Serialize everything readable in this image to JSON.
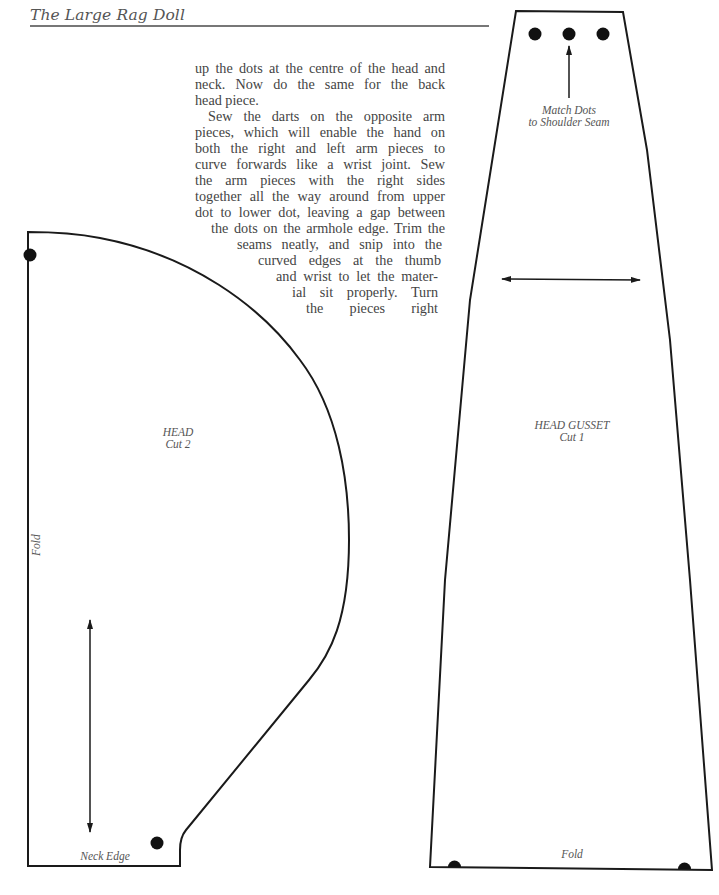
{
  "header": {
    "title": "The Large Rag Doll"
  },
  "body_text": {
    "lines": [
      "up the dots at the centre of the head and",
      "neck. Now do the same for the back",
      "head piece.",
      "Sew the darts on the opposite arm",
      "pieces, which will enable the hand on",
      "both the right and left arm pieces to",
      "curve forwards like a wrist joint. Sew",
      "the arm pieces with the right sides",
      "together all the way around from upper",
      "dot to lower dot, leaving a gap between",
      "the dots on the armhole edge. Trim the",
      "seams neatly, and snip into the",
      "curved edges at the thumb",
      "and wrist to let the mater-",
      "ial sit properly. Turn",
      "the pieces right"
    ]
  },
  "pattern_pieces": {
    "head": {
      "name": "HEAD",
      "cut": "Cut 2",
      "fold_label": "Fold",
      "neck_label": "Neck Edge"
    },
    "head_gusset": {
      "name": "HEAD GUSSET",
      "cut": "Cut 1",
      "match_label_1": "Match Dots",
      "match_label_2": "to Shoulder Seam",
      "fold_label": "Fold"
    }
  },
  "colors": {
    "line": "#1a1a1a",
    "text": "#444444",
    "rule": "#777777"
  }
}
